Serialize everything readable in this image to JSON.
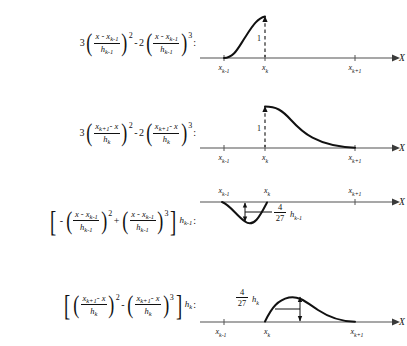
{
  "figure": {
    "axis_variable": "X",
    "curve_color": "#111111",
    "axis_color": "#8a8a8a"
  },
  "ticks": {
    "left": "x",
    "left_sub": "k-1",
    "mid": "x",
    "mid_sub": "k",
    "right": "x",
    "right_sub": "k+1"
  },
  "rows": [
    {
      "id": "row-0",
      "formula": {
        "coefficient_1": "3",
        "numerator_1": "x - x",
        "numerator_1_sub": "k-1",
        "denominator_1": "h",
        "denominator_1_sub": "k-1",
        "exponent_1": "2",
        "operator": "-",
        "coefficient_2": "2",
        "numerator_2": "x - x",
        "numerator_2_sub": "k-1",
        "denominator_2": "h",
        "denominator_2_sub": "k-1",
        "exponent_2": "3",
        "trailing": "",
        "colon": ":"
      },
      "plot": {
        "shape": "rising-s-curve",
        "value_label": "1",
        "dashed_marker": true,
        "support_from": "x_{k-1}",
        "support_to": "x_k"
      }
    },
    {
      "id": "row-1",
      "formula": {
        "coefficient_1": "3",
        "numerator_1": "x",
        "numerator_1_sub": "k+1",
        "numerator_1_tail": "- x",
        "denominator_1": "h",
        "denominator_1_sub": "k",
        "exponent_1": "2",
        "operator": "-",
        "coefficient_2": "2",
        "numerator_2": "x",
        "numerator_2_sub": "k+1",
        "numerator_2_tail": "- x",
        "denominator_2": "h",
        "denominator_2_sub": "k",
        "exponent_2": "3",
        "trailing": "",
        "colon": ":"
      },
      "plot": {
        "shape": "falling-s-curve",
        "value_label": "1",
        "dashed_marker": true,
        "support_from": "x_k",
        "support_to": "x_{k+1}"
      }
    },
    {
      "id": "row-2",
      "formula": {
        "bracket": true,
        "coefficient_1": "-",
        "numerator_1": "x - x",
        "numerator_1_sub": "k-1",
        "denominator_1": "h",
        "denominator_1_sub": "k-1",
        "exponent_1": "2",
        "operator": "+",
        "numerator_2": "x - x",
        "numerator_2_sub": "k-1",
        "denominator_2": "h",
        "denominator_2_sub": "k-1",
        "exponent_2": "3",
        "trailing": "h",
        "trailing_sub": "k-1",
        "colon": ":"
      },
      "plot": {
        "shape": "negative-bump",
        "annotation_num": "4",
        "annotation_den": "27",
        "annotation_factor": "h",
        "annotation_factor_sub": "k-1",
        "support_from": "x_{k-1}",
        "support_to": "x_k"
      }
    },
    {
      "id": "row-3",
      "formula": {
        "bracket": true,
        "numerator_1": "x",
        "numerator_1_sub": "k+1",
        "numerator_1_tail": "- x",
        "denominator_1": "h",
        "denominator_1_sub": "k",
        "exponent_1": "2",
        "operator": "-",
        "numerator_2": "x",
        "numerator_2_sub": "k+1",
        "numerator_2_tail": "- x",
        "denominator_2": "h",
        "denominator_2_sub": "k",
        "exponent_2": "3",
        "trailing": "h",
        "trailing_sub": "k",
        "colon": ":"
      },
      "plot": {
        "shape": "positive-bump",
        "annotation_num": "4",
        "annotation_den": "27",
        "annotation_factor": "h",
        "annotation_factor_sub": "k",
        "support_from": "x_k",
        "support_to": "x_{k+1}"
      }
    }
  ]
}
